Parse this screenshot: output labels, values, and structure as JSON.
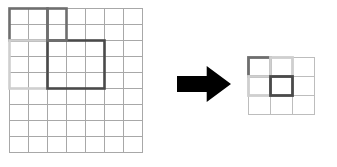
{
  "figure": {
    "background_color": "#ffffff"
  },
  "colors": {
    "grid_line": "#a8a8a8",
    "grid_line_light": "#bdbdbd",
    "highlight_dark_gray": "#6e6e6e",
    "highlight_light_gray": "#cfcfcf",
    "highlight_black": "#4a4a4a",
    "arrow_fill": "#000000"
  },
  "source_grid": {
    "name": "source-grid",
    "columns": 7,
    "rows": 9,
    "x": 9,
    "y": 8,
    "cell_width": 19,
    "cell_height": 16,
    "line_color": "#a8a8a8",
    "line_width": 1,
    "highlights": [
      {
        "name": "dark-gray-region",
        "color": "#6e6e6e",
        "col": 0,
        "row": 0,
        "col_span": 2,
        "row_span": 2,
        "stroke_width": 2.6
      },
      {
        "name": "light-gray-region",
        "color": "#cfcfcf",
        "col": 0,
        "row": 2,
        "col_span": 2,
        "row_span": 3,
        "stroke_width": 2.6
      },
      {
        "name": "black-region",
        "color": "#4a4a4a",
        "col": 2,
        "row": 2,
        "col_span": 3,
        "row_span": 3,
        "stroke_width": 2.6
      },
      {
        "name": "dark-gray-region-upper-right",
        "color": "#6e6e6e",
        "col": 2,
        "row": 0,
        "col_span": 1,
        "row_span": 2,
        "stroke_width": 2.6
      }
    ]
  },
  "arrow": {
    "name": "transform-arrow",
    "direction": "right",
    "x": 177,
    "y": 66,
    "width": 54,
    "height": 36,
    "fill": "#000000"
  },
  "result_grid": {
    "name": "result-grid",
    "columns": 3,
    "rows": 3,
    "x": 248,
    "y": 57,
    "cell_width": 22,
    "cell_height": 19,
    "line_color": "#bdbdbd",
    "line_width": 1,
    "highlights": [
      {
        "name": "dark-gray-cell",
        "color": "#6e6e6e",
        "col": 0,
        "row": 0,
        "col_span": 1,
        "row_span": 1,
        "stroke_width": 2.8
      },
      {
        "name": "light-gray-cell-top",
        "color": "#cfcfcf",
        "col": 1,
        "row": 0,
        "col_span": 1,
        "row_span": 1,
        "stroke_width": 2.8
      },
      {
        "name": "light-gray-cell-left",
        "color": "#cfcfcf",
        "col": 0,
        "row": 1,
        "col_span": 1,
        "row_span": 1,
        "stroke_width": 2.8
      },
      {
        "name": "black-cell",
        "color": "#4a4a4a",
        "col": 1,
        "row": 1,
        "col_span": 1,
        "row_span": 1,
        "stroke_width": 2.8
      }
    ]
  }
}
